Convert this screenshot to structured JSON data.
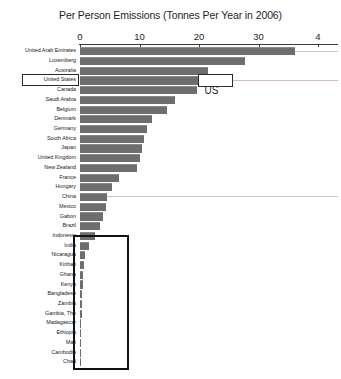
{
  "chart_data": {
    "type": "bar",
    "orientation": "horizontal",
    "title": "Per Person Emissions (Tonnes Per Year in 2006)",
    "xlabel": "",
    "ylabel": "",
    "xlim": [
      0,
      43.5
    ],
    "xticks": [
      0,
      10,
      20,
      30,
      40
    ],
    "xtick_labels": [
      "0",
      "10",
      "20",
      "30",
      "4"
    ],
    "grid": false,
    "legend": false,
    "bar_color": "#6e6e6e",
    "categories": [
      "United Arab Emirates",
      "Luxemberg",
      "Australia",
      "United States",
      "Canada",
      "Saudi Arabia",
      "Belgium",
      "Denmark",
      "Germany",
      "South Africa",
      "Japan",
      "United Kingdom",
      "New Zealand",
      "France",
      "Hungary",
      "China",
      "Mexico",
      "Gabon",
      "Brazil",
      "Indonesia",
      "India",
      "Nicaragua",
      "Kiribati",
      "Ghana",
      "Kenya",
      "Bangladesh",
      "Zambia",
      "Gambia, The",
      "Madagascar",
      "Ethiopia",
      "Mali",
      "Cambodia",
      "Chad"
    ],
    "values": [
      36.1,
      27.8,
      21.5,
      21.3,
      19.6,
      16.0,
      14.7,
      12.1,
      11.3,
      10.8,
      10.4,
      10.1,
      9.6,
      6.6,
      5.4,
      4.5,
      4.3,
      3.9,
      3.3,
      2.5,
      1.5,
      0.8,
      0.6,
      0.5,
      0.45,
      0.4,
      0.35,
      0.3,
      0.25,
      0.2,
      0.18,
      0.15,
      0.1
    ]
  },
  "annotations": {
    "us_callout_label": "US",
    "us_highlight_country": "United States",
    "low_emitters_box_from": "India",
    "low_emitters_box_to": "Chad"
  }
}
